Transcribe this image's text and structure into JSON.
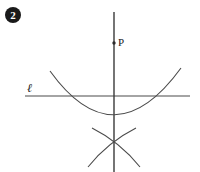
{
  "figure": {
    "badge": {
      "number": "2",
      "icon": "filled-circle-number-badge"
    },
    "labels": {
      "point_p": "P",
      "line_l": "ℓ"
    },
    "colors": {
      "ink": "#3a3a3a",
      "badge_fill": "#1a1a1a",
      "badge_text": "#ffffff",
      "background": "#ffffff"
    },
    "geometry": {
      "vertical_line": {
        "x": 114,
        "y_top": 12,
        "y_bottom": 172
      },
      "horizontal_line": {
        "y": 96,
        "x_left": 25,
        "x_right": 190
      },
      "point_p": {
        "x": 114,
        "y": 43,
        "radius": 1.6
      },
      "main_arc": {
        "left_end": {
          "x": 50,
          "y": 71
        },
        "right_end": {
          "x": 181,
          "y": 68
        },
        "bottom": {
          "x": 114,
          "y": 115
        }
      },
      "construction_arc_1": {
        "start": {
          "x": 92,
          "y": 128
        },
        "end": {
          "x": 140,
          "y": 167
        }
      },
      "construction_arc_2": {
        "start": {
          "x": 136,
          "y": 128
        },
        "end": {
          "x": 88,
          "y": 167
        }
      },
      "arc_intersection": {
        "x": 114,
        "y": 147
      }
    }
  }
}
